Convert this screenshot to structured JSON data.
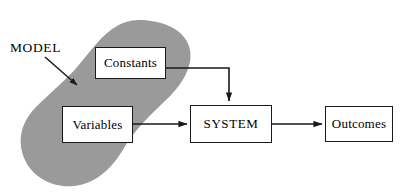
{
  "diagram": {
    "region_label": "MODEL",
    "region_fill": "#9a9a9a",
    "line_color": "#1a1a1a",
    "background": "#ffffff",
    "nodes": [
      {
        "id": "constants",
        "label": "Constants",
        "inside_model_region": true
      },
      {
        "id": "variables",
        "label": "Variables",
        "inside_model_region": true
      },
      {
        "id": "system",
        "label": "SYSTEM",
        "inside_model_region": false
      },
      {
        "id": "outcomes",
        "label": "Outcomes",
        "inside_model_region": false
      }
    ],
    "connectors": [
      {
        "from": "constants",
        "to": "system",
        "style": "elbow-right-down",
        "arrow": "to-top-of-system"
      },
      {
        "from": "variables",
        "to": "system",
        "style": "straight-right",
        "arrow": "to-left-of-system"
      },
      {
        "from": "system",
        "to": "outcomes",
        "style": "straight-right",
        "arrow": "to-left-of-outcomes"
      },
      {
        "from": "region_label",
        "to": "model_region",
        "style": "pointer-arrow",
        "arrow": "into-gray-region"
      }
    ]
  }
}
